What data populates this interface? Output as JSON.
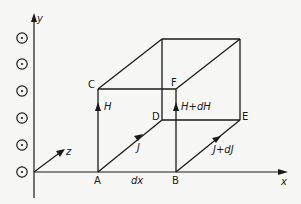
{
  "figure": {
    "axes": {
      "x_label": "x",
      "y_label": "y",
      "z_label": "z"
    },
    "vertices": {
      "A": "A",
      "B": "B",
      "C": "C",
      "D": "D",
      "E": "E",
      "F": "F"
    },
    "vectors": {
      "H": "H",
      "H_plus_dH": "H+dH",
      "J": "J",
      "J_plus_dJ": "J+dJ"
    },
    "dimension_label": "dx",
    "out_of_page_markers": 6,
    "colors": {
      "ink": "#1a1a1a",
      "background": "#f7f7f5"
    }
  }
}
